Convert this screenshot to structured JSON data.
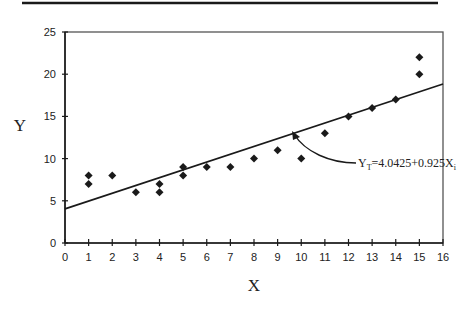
{
  "chart_data": {
    "type": "scatter",
    "title": "",
    "xlabel": "X",
    "ylabel": "Y",
    "xlim": [
      0,
      16
    ],
    "ylim": [
      0,
      25
    ],
    "x_ticks": [
      0,
      1,
      2,
      3,
      4,
      5,
      6,
      7,
      8,
      9,
      10,
      11,
      12,
      13,
      14,
      15,
      16
    ],
    "y_ticks": [
      0,
      5,
      10,
      15,
      20,
      25
    ],
    "grid": false,
    "legend": null,
    "series": [
      {
        "name": "observations",
        "type": "scatter",
        "marker": "diamond",
        "points": [
          {
            "x": 1,
            "y": 8
          },
          {
            "x": 1,
            "y": 7
          },
          {
            "x": 2,
            "y": 8
          },
          {
            "x": 3,
            "y": 6
          },
          {
            "x": 4,
            "y": 7
          },
          {
            "x": 4,
            "y": 6
          },
          {
            "x": 5,
            "y": 9
          },
          {
            "x": 5,
            "y": 8
          },
          {
            "x": 6,
            "y": 9
          },
          {
            "x": 7,
            "y": 9
          },
          {
            "x": 8,
            "y": 10
          },
          {
            "x": 9,
            "y": 11
          },
          {
            "x": 10,
            "y": 10
          },
          {
            "x": 11,
            "y": 13
          },
          {
            "x": 12,
            "y": 15
          },
          {
            "x": 13,
            "y": 16
          },
          {
            "x": 14,
            "y": 17
          },
          {
            "x": 15,
            "y": 22
          },
          {
            "x": 15,
            "y": 20
          }
        ]
      },
      {
        "name": "regression line",
        "type": "line",
        "intercept": 4.0425,
        "slope": 0.925,
        "points": [
          {
            "x": 0,
            "y": 4.0425
          },
          {
            "x": 16,
            "y": 18.8425
          }
        ]
      }
    ],
    "annotations": [
      {
        "text_main": "Y",
        "text_sub": "T",
        "text_rest": "=4.0425+0.925X",
        "text_sub2": "i",
        "points_to": {
          "x": 9.8,
          "y": 13.1
        }
      }
    ]
  },
  "labels": {
    "xlabel": "X",
    "ylabel": "Y",
    "equation_y": "Y",
    "equation_y_sub": "T",
    "equation_body": "=4.0425+0.925X",
    "equation_x_sub": "i"
  },
  "colors": {
    "ink": "#1a1a1a",
    "background": "#ffffff"
  }
}
